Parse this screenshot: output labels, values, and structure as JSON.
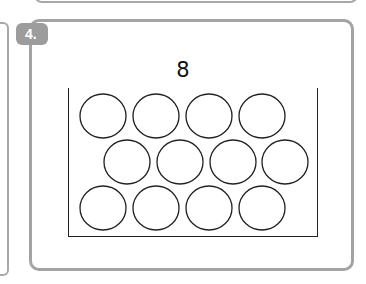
{
  "question": {
    "number_label": "4.",
    "target_number": "8"
  },
  "frame": {
    "rows": [
      {
        "count": 4,
        "offset": 0
      },
      {
        "count": 4,
        "offset": 1
      },
      {
        "count": 4,
        "offset": 0
      }
    ],
    "total_circles": 12
  },
  "colors": {
    "card_border": "#a3a3a3",
    "badge_bg": "#9c9c9c",
    "line": "#222222"
  }
}
